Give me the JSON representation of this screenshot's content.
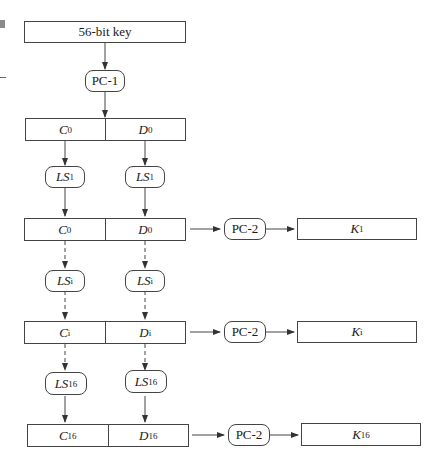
{
  "diagram": {
    "input": {
      "label": "56-bit key"
    },
    "pc1": {
      "label": "PC-1"
    },
    "pc2_label": "PC-2",
    "rows": [
      {
        "c": {
          "base": "C",
          "sub": "0"
        },
        "d": {
          "base": "D",
          "sub": "0"
        }
      },
      {
        "shift": {
          "base": "LS",
          "sub": "1"
        },
        "c": {
          "base": "C",
          "sub": "0"
        },
        "d": {
          "base": "D",
          "sub": "0"
        },
        "key": {
          "base": "K",
          "sub": "1"
        }
      },
      {
        "shift": {
          "base": "LS",
          "sub": "i"
        },
        "c": {
          "base": "C",
          "sub": "i"
        },
        "d": {
          "base": "D",
          "sub": "i"
        },
        "key": {
          "base": "K",
          "sub": "i"
        }
      },
      {
        "shift": {
          "base": "LS",
          "sub": "16"
        },
        "c": {
          "base": "C",
          "sub": "16"
        },
        "d": {
          "base": "D",
          "sub": "16"
        },
        "key": {
          "base": "K",
          "sub": "16"
        }
      }
    ],
    "colors": {
      "stroke": "#444444",
      "text": "#1a1a1a",
      "background": "#ffffff"
    }
  }
}
